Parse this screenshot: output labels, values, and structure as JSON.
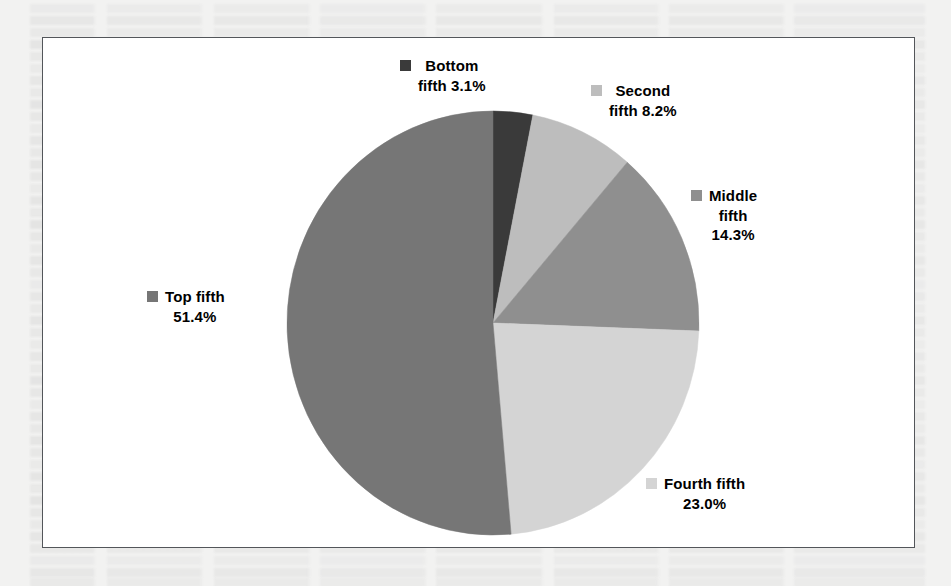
{
  "figure": {
    "background_color": "#ffffff",
    "border_color": "#53565a",
    "page_color": "#f2f2f1"
  },
  "chart_data": {
    "type": "pie",
    "title": "",
    "subtitle": "",
    "xlabel": "",
    "ylabel": "",
    "grid": false,
    "legend_position": "callout-labels",
    "start_angle_deg": 0,
    "direction": "clockwise",
    "categories": [
      "Bottom fifth",
      "Second fifth",
      "Middle fifth",
      "Fourth fifth",
      "Top fifth"
    ],
    "values": [
      3.1,
      8.2,
      14.3,
      23.0,
      51.4
    ],
    "value_unit": "%",
    "colors": [
      "#3a3a3a",
      "#bdbdbd",
      "#8f8f8f",
      "#d4d4d4",
      "#767676"
    ],
    "slices": [
      {
        "name": "Bottom fifth",
        "value": 3.1,
        "label_text": "Bottom\nfifth 3.1%",
        "color": "#3a3a3a"
      },
      {
        "name": "Second fifth",
        "value": 8.2,
        "label_text": "Second\nfifth 8.2%",
        "color": "#bdbdbd"
      },
      {
        "name": "Middle fifth",
        "value": 14.3,
        "label_text": "Middle\nfifth\n14.3%",
        "color": "#8f8f8f"
      },
      {
        "name": "Fourth fifth",
        "value": 23.0,
        "label_text": "Fourth fifth\n23.0%",
        "color": "#d4d4d4"
      },
      {
        "name": "Top fifth",
        "value": 51.4,
        "label_text": "Top fifth\n51.4%",
        "color": "#767676"
      }
    ]
  }
}
